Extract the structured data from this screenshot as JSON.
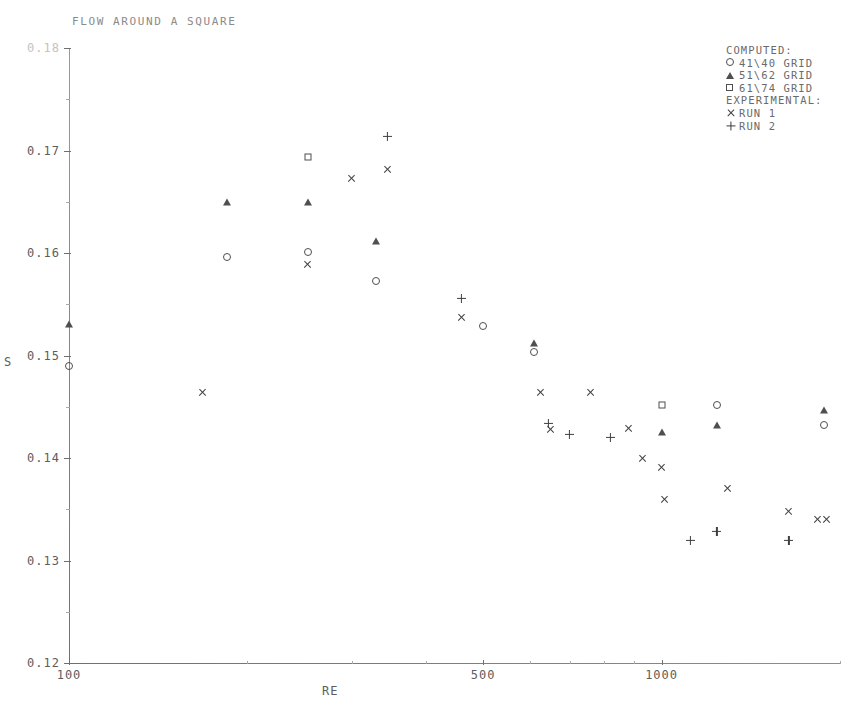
{
  "chart_data": {
    "type": "scatter",
    "title": "FLOW AROUND A SQUARE",
    "xlabel": "RE",
    "ylabel": "S",
    "xscale": "log",
    "xlim": [
      100,
      2000
    ],
    "ylim": [
      0.12,
      0.18
    ],
    "yticks": [
      "0.18",
      "0.17",
      "0.16",
      "0.15",
      "0.14",
      "0.13",
      "0.12"
    ],
    "ytick_values": [
      0.18,
      0.17,
      0.16,
      0.15,
      0.14,
      0.13,
      0.12
    ],
    "xticks": [
      "100",
      "500",
      "1000"
    ],
    "xtick_values": [
      100,
      500,
      1000
    ],
    "grid": false,
    "legend_position": "top-right",
    "series": [
      {
        "name": "41\\40 GRID",
        "group": "COMPUTED",
        "marker": "circle",
        "points": [
          {
            "x": 100,
            "y": 0.149
          },
          {
            "x": 185,
            "y": 0.1596
          },
          {
            "x": 253,
            "y": 0.1601
          },
          {
            "x": 330,
            "y": 0.1573
          },
          {
            "x": 500,
            "y": 0.1529
          },
          {
            "x": 610,
            "y": 0.1503
          },
          {
            "x": 1240,
            "y": 0.1452
          },
          {
            "x": 1880,
            "y": 0.1432
          }
        ]
      },
      {
        "name": "51\\62 GRID",
        "group": "COMPUTED",
        "marker": "triangle",
        "points": [
          {
            "x": 100,
            "y": 0.1531
          },
          {
            "x": 185,
            "y": 0.165
          },
          {
            "x": 253,
            "y": 0.165
          },
          {
            "x": 330,
            "y": 0.1612
          },
          {
            "x": 610,
            "y": 0.1512
          },
          {
            "x": 1000,
            "y": 0.1425
          },
          {
            "x": 1240,
            "y": 0.1432
          },
          {
            "x": 1880,
            "y": 0.1447
          }
        ]
      },
      {
        "name": "61\\74 GRID",
        "group": "COMPUTED",
        "marker": "square",
        "points": [
          {
            "x": 253,
            "y": 0.1694
          },
          {
            "x": 1000,
            "y": 0.1452
          }
        ]
      },
      {
        "name": "RUN 1",
        "group": "EXPERIMENTAL",
        "marker": "cross",
        "points": [
          {
            "x": 168,
            "y": 0.1464
          },
          {
            "x": 253,
            "y": 0.1589
          },
          {
            "x": 300,
            "y": 0.1673
          },
          {
            "x": 345,
            "y": 0.1681
          },
          {
            "x": 460,
            "y": 0.1537
          },
          {
            "x": 625,
            "y": 0.1464
          },
          {
            "x": 650,
            "y": 0.1428
          },
          {
            "x": 760,
            "y": 0.1464
          },
          {
            "x": 880,
            "y": 0.1429
          },
          {
            "x": 930,
            "y": 0.14
          },
          {
            "x": 1000,
            "y": 0.1391
          },
          {
            "x": 1010,
            "y": 0.136
          },
          {
            "x": 1290,
            "y": 0.137
          },
          {
            "x": 1640,
            "y": 0.1348
          },
          {
            "x": 1830,
            "y": 0.134
          },
          {
            "x": 1900,
            "y": 0.134
          }
        ]
      },
      {
        "name": "RUN 2",
        "group": "EXPERIMENTAL",
        "marker": "plus",
        "points": [
          {
            "x": 345,
            "y": 0.1714
          },
          {
            "x": 460,
            "y": 0.1556
          },
          {
            "x": 645,
            "y": 0.1434
          },
          {
            "x": 700,
            "y": 0.1423
          },
          {
            "x": 820,
            "y": 0.142
          },
          {
            "x": 1120,
            "y": 0.132
          },
          {
            "x": 1240,
            "y": 0.1328
          },
          {
            "x": 1640,
            "y": 0.132
          }
        ]
      }
    ]
  },
  "legend": {
    "computed_header": "COMPUTED:",
    "experimental_header": "EXPERIMENTAL:",
    "entries": [
      {
        "marker": "circle",
        "label": "41\\40 GRID"
      },
      {
        "marker": "triangle",
        "label": "51\\62 GRID"
      },
      {
        "marker": "square",
        "label": "61\\74 GRID"
      },
      {
        "marker": "cross",
        "label": "RUN 1"
      },
      {
        "marker": "plus",
        "label": "RUN 2"
      }
    ]
  },
  "colors": {
    "ink": "#4f4f4f",
    "axis": "#6f6f6f",
    "text": "#5d5d5d",
    "faint": "#c3c3c3",
    "background": "#ffffff"
  }
}
